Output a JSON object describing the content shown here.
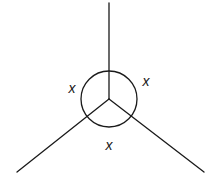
{
  "figure": {
    "panel_label": ")",
    "stroke_color": "#1a1a1a",
    "background": "#ffffff"
  },
  "geometry": {
    "center": {
      "x": 109,
      "y": 99
    },
    "circle_radius": 28,
    "rays": [
      {
        "name": "up",
        "end": {
          "x": 109,
          "y": 3
        }
      },
      {
        "name": "lower-left",
        "end": {
          "x": 17,
          "y": 172
        }
      },
      {
        "name": "lower-right",
        "end": {
          "x": 204,
          "y": 172
        }
      }
    ]
  },
  "labels": {
    "angle_left": "x",
    "angle_right": "x",
    "angle_bottom": "x"
  }
}
